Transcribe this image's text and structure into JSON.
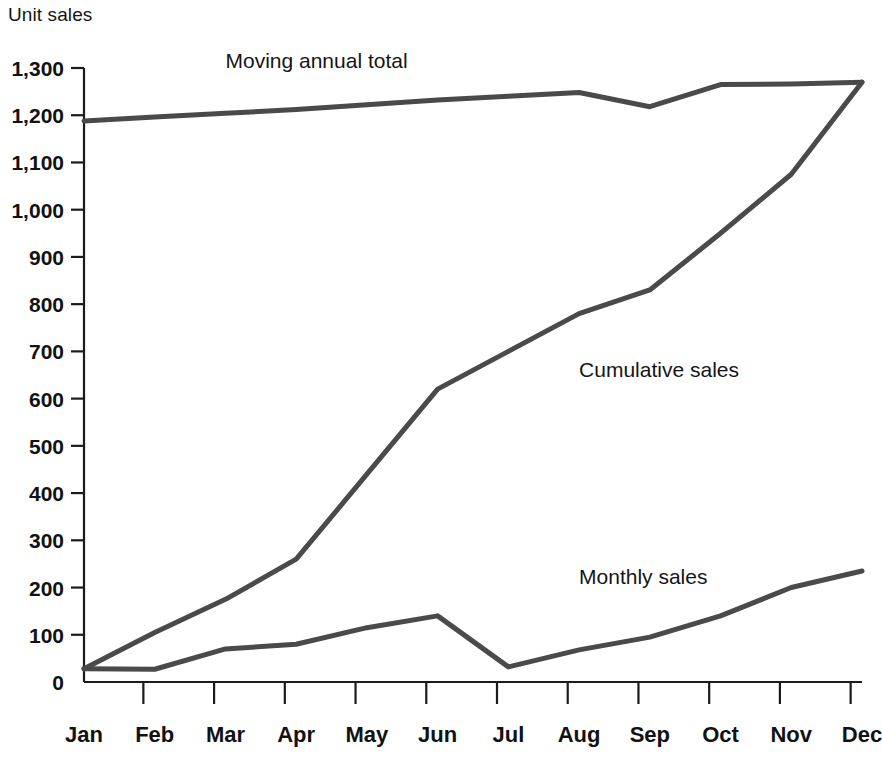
{
  "chart_data": {
    "type": "line",
    "title": "",
    "ylabel": "Unit sales",
    "xlabel": "",
    "ylim": [
      0,
      1300
    ],
    "ytick_step": 100,
    "grid": false,
    "legend_position": "inline-annotations",
    "categories": [
      "Jan",
      "Feb",
      "Mar",
      "Apr",
      "May",
      "Jun",
      "Jul",
      "Aug",
      "Sep",
      "Oct",
      "Nov",
      "Dec"
    ],
    "ytick_labels": [
      "0",
      "100",
      "200",
      "300",
      "400",
      "500",
      "600",
      "700",
      "800",
      "900",
      "1,000",
      "1,100",
      "1,200",
      "1,300"
    ],
    "ytick_values": [
      0,
      100,
      200,
      300,
      400,
      500,
      600,
      700,
      800,
      900,
      1000,
      1100,
      1200,
      1300
    ],
    "series": [
      {
        "name": "Monthly sales",
        "label": "Monthly sales",
        "color": "#4a4a4a",
        "values": [
          28,
          27,
          70,
          80,
          115,
          140,
          32,
          68,
          95,
          140,
          200,
          235
        ]
      },
      {
        "name": "Cumulative sales",
        "label": "Cumulative sales",
        "color": "#4a4a4a",
        "values": [
          28,
          105,
          175,
          260,
          440,
          620,
          700,
          780,
          830,
          950,
          1075,
          1270
        ]
      },
      {
        "name": "Moving annual total",
        "label": "Moving annual total",
        "color": "#4a4a4a",
        "values": [
          1188,
          1196,
          1204,
          1212,
          1222,
          1232,
          1240,
          1248,
          1218,
          1265,
          1266,
          1270
        ]
      }
    ],
    "annotations": [
      {
        "text": "Moving annual total",
        "x_month": "Mar",
        "y_value": 1300
      },
      {
        "text": "Cumulative sales",
        "x_month": "Aug",
        "y_value": 645
      },
      {
        "text": "Monthly sales",
        "x_month": "Aug",
        "y_value": 208
      }
    ]
  },
  "axis": {
    "y_axis_title": "Unit sales"
  }
}
